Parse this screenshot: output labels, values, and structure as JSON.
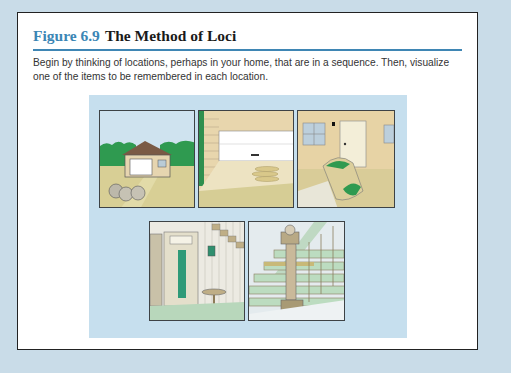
{
  "figure": {
    "number": "Figure 6.9",
    "title": "The Method of Loci",
    "caption": "Begin by thinking of locations, perhaps in your home, that are in a sequence. Then, visualize one of the items to be remembered in each location."
  },
  "illustration": {
    "background_color": "#c6dfee",
    "accent_color": "#3b86b5",
    "panels": [
      {
        "id": 1,
        "scene": "house exterior with driveway and apples"
      },
      {
        "id": 2,
        "scene": "garage with open door and items on floor"
      },
      {
        "id": 3,
        "scene": "house entrance with spilled bags"
      },
      {
        "id": 4,
        "scene": "hallway closet with coat and stool"
      },
      {
        "id": 5,
        "scene": "staircase with items on steps"
      }
    ]
  }
}
